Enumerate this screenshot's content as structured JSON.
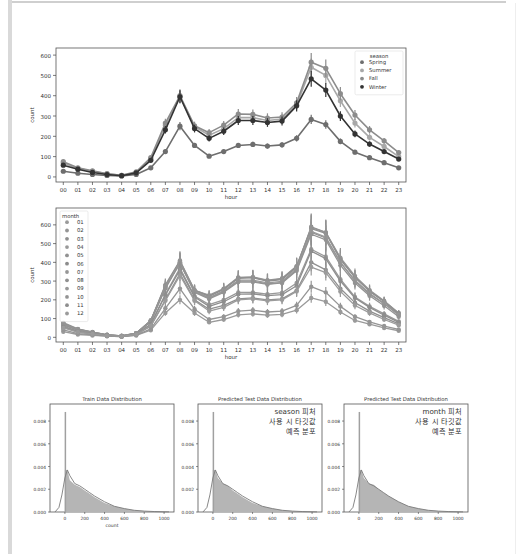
{
  "chart_data": [
    {
      "type": "line",
      "title": "",
      "xlabel": "hour",
      "ylabel": "count",
      "ylim": [
        -25,
        635
      ],
      "yticks": [
        0,
        100,
        200,
        300,
        400,
        500,
        600
      ],
      "categories": [
        "00",
        "01",
        "02",
        "03",
        "04",
        "05",
        "06",
        "07",
        "08",
        "09",
        "10",
        "11",
        "12",
        "13",
        "14",
        "15",
        "16",
        "17",
        "18",
        "19",
        "20",
        "21",
        "22",
        "23"
      ],
      "legend": {
        "title": "season",
        "position": "upper right"
      },
      "series": [
        {
          "name": "Spring",
          "color": "#6e6e6e",
          "values": [
            28,
            18,
            12,
            7,
            5,
            12,
            45,
            125,
            250,
            155,
            102,
            125,
            155,
            160,
            152,
            158,
            190,
            283,
            258,
            175,
            122,
            95,
            70,
            45
          ]
        },
        {
          "name": "Summer",
          "color": "#a8a8a8",
          "values": [
            68,
            42,
            28,
            15,
            8,
            22,
            90,
            255,
            395,
            248,
            205,
            238,
            292,
            292,
            278,
            285,
            355,
            540,
            500,
            375,
            265,
            195,
            150,
            100
          ]
        },
        {
          "name": "Fall",
          "color": "#8c8c8c",
          "values": [
            75,
            45,
            30,
            16,
            8,
            25,
            95,
            265,
            400,
            252,
            218,
            255,
            310,
            308,
            290,
            295,
            365,
            565,
            535,
            410,
            305,
            232,
            178,
            120
          ]
        },
        {
          "name": "Winter",
          "color": "#333333",
          "values": [
            58,
            38,
            22,
            12,
            6,
            20,
            82,
            232,
            395,
            238,
            190,
            225,
            278,
            278,
            268,
            275,
            350,
            483,
            428,
            300,
            212,
            162,
            125,
            88
          ]
        }
      ]
    },
    {
      "type": "line",
      "title": "",
      "xlabel": "hour",
      "ylabel": "count",
      "ylim": [
        -25,
        690
      ],
      "yticks": [
        0,
        100,
        200,
        300,
        400,
        500,
        600
      ],
      "categories": [
        "00",
        "01",
        "02",
        "03",
        "04",
        "05",
        "06",
        "07",
        "08",
        "09",
        "10",
        "11",
        "12",
        "13",
        "14",
        "15",
        "16",
        "17",
        "18",
        "19",
        "20",
        "21",
        "22",
        "23"
      ],
      "legend": {
        "title": "month",
        "position": "upper left"
      },
      "series": [
        {
          "name": "01",
          "values": [
            30,
            15,
            10,
            6,
            4,
            10,
            38,
            130,
            200,
            130,
            80,
            95,
            120,
            125,
            118,
            122,
            145,
            210,
            190,
            135,
            90,
            70,
            50,
            35
          ]
        },
        {
          "name": "02",
          "values": [
            40,
            20,
            13,
            7,
            4,
            12,
            45,
            155,
            260,
            150,
            95,
            110,
            140,
            145,
            135,
            140,
            170,
            270,
            240,
            165,
            110,
            82,
            60,
            42
          ]
        },
        {
          "name": "03",
          "values": [
            55,
            28,
            18,
            9,
            5,
            15,
            60,
            200,
            340,
            200,
            150,
            170,
            205,
            210,
            200,
            205,
            250,
            400,
            360,
            260,
            185,
            140,
            105,
            72
          ]
        },
        {
          "name": "04",
          "values": [
            60,
            33,
            20,
            10,
            6,
            18,
            70,
            230,
            370,
            220,
            175,
            200,
            240,
            240,
            230,
            238,
            290,
            470,
            430,
            310,
            215,
            165,
            125,
            85
          ]
        },
        {
          "name": "05",
          "values": [
            70,
            40,
            25,
            12,
            7,
            20,
            85,
            265,
            400,
            245,
            210,
            245,
            300,
            300,
            285,
            292,
            360,
            560,
            530,
            400,
            300,
            230,
            180,
            120
          ]
        },
        {
          "name": "06",
          "values": [
            75,
            42,
            27,
            13,
            7,
            22,
            90,
            275,
            405,
            250,
            220,
            255,
            315,
            318,
            300,
            308,
            375,
            590,
            560,
            420,
            320,
            245,
            192,
            130
          ]
        },
        {
          "name": "07",
          "values": [
            78,
            45,
            28,
            14,
            8,
            22,
            88,
            270,
            395,
            250,
            225,
            260,
            320,
            322,
            305,
            315,
            380,
            585,
            560,
            425,
            328,
            252,
            195,
            128
          ]
        },
        {
          "name": "08",
          "values": [
            75,
            43,
            27,
            13,
            7,
            22,
            90,
            280,
            410,
            252,
            220,
            258,
            318,
            320,
            302,
            312,
            378,
            580,
            555,
            415,
            320,
            248,
            190,
            125
          ]
        },
        {
          "name": "09",
          "values": [
            70,
            40,
            25,
            12,
            7,
            20,
            88,
            270,
            400,
            245,
            210,
            248,
            305,
            305,
            290,
            298,
            368,
            565,
            535,
            400,
            305,
            235,
            180,
            118
          ]
        },
        {
          "name": "10",
          "values": [
            65,
            38,
            24,
            12,
            6,
            20,
            85,
            260,
            395,
            240,
            205,
            240,
            295,
            295,
            282,
            290,
            355,
            550,
            520,
            385,
            290,
            222,
            168,
            110
          ]
        },
        {
          "name": "11",
          "values": [
            55,
            30,
            20,
            10,
            5,
            16,
            70,
            225,
            360,
            215,
            165,
            190,
            230,
            232,
            222,
            228,
            275,
            460,
            420,
            300,
            210,
            160,
            118,
            80
          ]
        },
        {
          "name": "12",
          "values": [
            50,
            28,
            18,
            9,
            5,
            15,
            62,
            195,
            330,
            195,
            140,
            160,
            200,
            205,
            195,
            200,
            245,
            375,
            345,
            245,
            170,
            130,
            95,
            65
          ]
        }
      ]
    },
    {
      "type": "area",
      "title": "Train Data Distribution",
      "xlabel": "count",
      "ylabel": "",
      "xlim": [
        -150,
        1100
      ],
      "ylim": [
        0,
        0.0095
      ],
      "xticks": [
        0,
        200,
        400,
        600,
        800,
        1000
      ],
      "yticks": [
        0.0,
        0.002,
        0.004,
        0.006,
        0.008
      ],
      "x": [
        0,
        25,
        50,
        100,
        150,
        200,
        250,
        300,
        400,
        500,
        600,
        700,
        800,
        900,
        1000
      ],
      "values": [
        0.0088,
        0.0037,
        0.0028,
        0.0024,
        0.0022,
        0.0019,
        0.0016,
        0.0013,
        0.0008,
        0.0005,
        0.0003,
        0.00015,
        8e-05,
        4e-05,
        1e-05
      ],
      "annotation": ""
    },
    {
      "type": "area",
      "title": "Predicted Test Data Distribution",
      "xlabel": "",
      "ylabel": "",
      "xlim": [
        -150,
        1100
      ],
      "ylim": [
        0,
        0.0095
      ],
      "xticks": [
        0,
        200,
        400,
        600,
        800,
        1000
      ],
      "yticks": [
        0.0,
        0.002,
        0.004,
        0.006,
        0.008
      ],
      "x": [
        0,
        25,
        50,
        100,
        150,
        200,
        250,
        300,
        400,
        500,
        600,
        700,
        800,
        900,
        1000
      ],
      "values": [
        0.0088,
        0.0037,
        0.003,
        0.0025,
        0.0023,
        0.0019,
        0.0016,
        0.0013,
        0.0008,
        0.0005,
        0.0003,
        0.00015,
        8e-05,
        4e-05,
        1e-05
      ],
      "annotation": "season 피처\n사용 시 타깃값\n예측 분포"
    },
    {
      "type": "area",
      "title": "Predicted Test Data Distribution",
      "xlabel": "",
      "ylabel": "",
      "xlim": [
        -150,
        1100
      ],
      "ylim": [
        0,
        0.0095
      ],
      "xticks": [
        0,
        200,
        400,
        600,
        800,
        1000
      ],
      "yticks": [
        0.0,
        0.002,
        0.004,
        0.006,
        0.008
      ],
      "x": [
        0,
        25,
        50,
        100,
        150,
        200,
        250,
        300,
        400,
        500,
        600,
        700,
        800,
        900,
        1000
      ],
      "values": [
        0.0088,
        0.0037,
        0.003,
        0.0025,
        0.0024,
        0.002,
        0.0017,
        0.0014,
        0.0009,
        0.0005,
        0.0003,
        0.00015,
        8e-05,
        4e-05,
        1e-05
      ],
      "annotation": "month 피처\n사용 시 타깃값\n예측 분포"
    }
  ],
  "labels": {
    "season_chart": {
      "legend_title": "season",
      "legend_items": [
        "Spring",
        "Summer",
        "Fall",
        "Winter"
      ],
      "xlabel": "hour",
      "ylabel": "count"
    },
    "month_chart": {
      "legend_title": "month",
      "legend_items": [
        "01",
        "02",
        "03",
        "04",
        "05",
        "06",
        "07",
        "08",
        "09",
        "10",
        "11",
        "12"
      ],
      "xlabel": "hour",
      "ylabel": "count"
    },
    "dist1": {
      "title": "Train Data Distribution",
      "xlabel": "count"
    },
    "dist2": {
      "title": "Predicted Test Data Distribution",
      "note_lines": [
        "season 피처",
        "사용 시 타깃값",
        "예측 분포"
      ]
    },
    "dist3": {
      "title": "Predicted Test Data Distribution",
      "note_lines": [
        "month 피처",
        "사용 시 타깃값",
        "예측 분포"
      ]
    }
  }
}
